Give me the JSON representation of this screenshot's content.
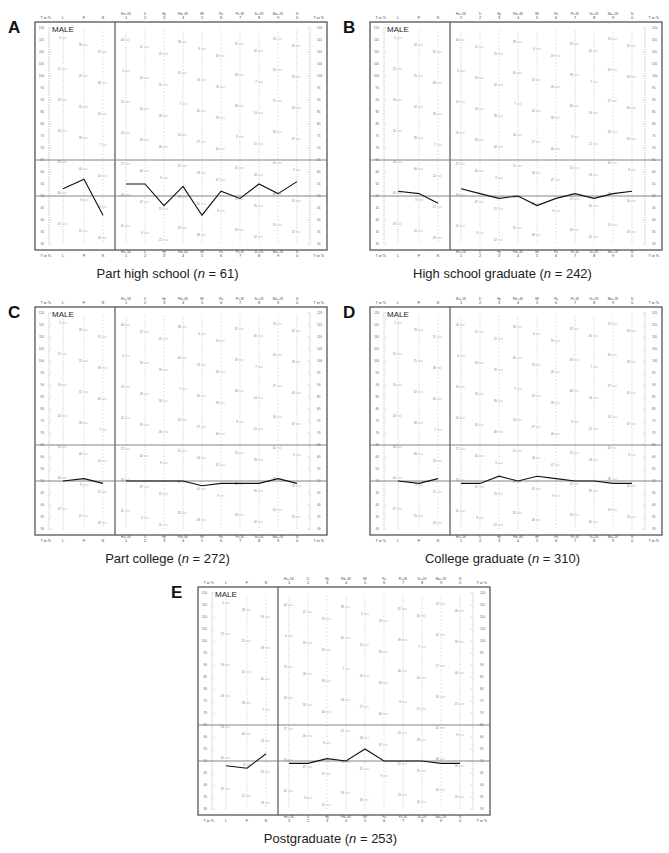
{
  "figure": {
    "sex_label": "MALE",
    "axis_label": "T or Tc",
    "y_ticks": [
      120,
      115,
      110,
      105,
      100,
      95,
      90,
      85,
      80,
      75,
      70,
      65,
      60,
      55,
      50,
      45,
      40,
      35,
      30
    ],
    "reference_lines": [
      65,
      50
    ],
    "validity_scales": [
      "L",
      "F",
      "K"
    ],
    "clinical_scales": [
      {
        "abbr": "Hs+.5K",
        "num": "1"
      },
      {
        "abbr": "D",
        "num": "2"
      },
      {
        "abbr": "Hy",
        "num": "3"
      },
      {
        "abbr": "Pd+.4K",
        "num": "4"
      },
      {
        "abbr": "Mf",
        "num": "5"
      },
      {
        "abbr": "Pa",
        "num": "6"
      },
      {
        "abbr": "Pt+1K",
        "num": "7"
      },
      {
        "abbr": "Sc+1K",
        "num": "8"
      },
      {
        "abbr": "Ma+.2K",
        "num": "9"
      },
      {
        "abbr": "Si",
        "num": "0"
      }
    ]
  },
  "panels": [
    {
      "letter": "A",
      "caption_pre": "Part high school (",
      "n_label": "n",
      "caption_post": " = 61)"
    },
    {
      "letter": "B",
      "caption_pre": "High school graduate (",
      "n_label": "n",
      "caption_post": " = 242)"
    },
    {
      "letter": "C",
      "caption_pre": "Part college (",
      "n_label": "n",
      "caption_post": " = 272)"
    },
    {
      "letter": "D",
      "caption_pre": "College graduate (",
      "n_label": "n",
      "caption_post": " = 310)"
    },
    {
      "letter": "E",
      "caption_pre": "Postgraduate (",
      "n_label": "n",
      "caption_post": " = 253)"
    }
  ],
  "chart_data": [
    {
      "type": "line",
      "panel": "A",
      "title": "Part high school (n = 61)",
      "categories": [
        "L",
        "F",
        "K",
        "1",
        "2",
        "3",
        "4",
        "5",
        "6",
        "7",
        "8",
        "9",
        "0"
      ],
      "validity": [
        53,
        57,
        42
      ],
      "clinical": [
        55,
        55,
        46,
        54,
        42,
        52,
        49,
        55,
        51,
        56
      ],
      "ylabel": "T or Tc",
      "ylim": [
        30,
        120
      ],
      "grid": false,
      "reference_lines": [
        50,
        65
      ]
    },
    {
      "type": "line",
      "panel": "B",
      "title": "High school graduate (n = 242)",
      "categories": [
        "L",
        "F",
        "K",
        "1",
        "2",
        "3",
        "4",
        "5",
        "6",
        "7",
        "8",
        "9",
        "0"
      ],
      "validity": [
        52,
        51,
        47
      ],
      "clinical": [
        53,
        51,
        49,
        50,
        46,
        49,
        51,
        49,
        51,
        52
      ],
      "ylabel": "T or Tc",
      "ylim": [
        30,
        120
      ],
      "grid": false,
      "reference_lines": [
        50,
        65
      ]
    },
    {
      "type": "line",
      "panel": "C",
      "title": "Part college (n = 272)",
      "categories": [
        "L",
        "F",
        "K",
        "1",
        "2",
        "3",
        "4",
        "5",
        "6",
        "7",
        "8",
        "9",
        "0"
      ],
      "validity": [
        50,
        51,
        49
      ],
      "clinical": [
        50,
        50,
        50,
        50,
        48,
        49,
        49,
        49,
        51,
        49
      ],
      "ylabel": "T or Tc",
      "ylim": [
        30,
        120
      ],
      "grid": false,
      "reference_lines": [
        50,
        65
      ]
    },
    {
      "type": "line",
      "panel": "D",
      "title": "College graduate (n = 310)",
      "categories": [
        "L",
        "F",
        "K",
        "1",
        "2",
        "3",
        "4",
        "5",
        "6",
        "7",
        "8",
        "9",
        "0"
      ],
      "validity": [
        50,
        49,
        51
      ],
      "clinical": [
        49,
        49,
        52,
        50,
        52,
        51,
        50,
        50,
        49,
        49
      ],
      "ylabel": "T or Tc",
      "ylim": [
        30,
        120
      ],
      "grid": false,
      "reference_lines": [
        50,
        65
      ]
    },
    {
      "type": "line",
      "panel": "E",
      "title": "Postgraduate (n = 253)",
      "categories": [
        "L",
        "F",
        "K",
        "1",
        "2",
        "3",
        "4",
        "5",
        "6",
        "7",
        "8",
        "9",
        "0"
      ],
      "validity": [
        48,
        47,
        53
      ],
      "clinical": [
        49,
        49,
        51,
        50,
        55,
        50,
        50,
        50,
        49,
        49
      ],
      "ylabel": "T or Tc",
      "ylim": [
        30,
        120
      ],
      "grid": false,
      "reference_lines": [
        50,
        65
      ]
    }
  ]
}
